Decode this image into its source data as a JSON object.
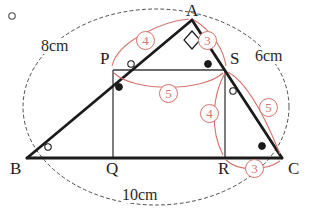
{
  "figure": {
    "vertices": [
      {
        "name": "A",
        "label": "A",
        "x": 192,
        "y": 20,
        "label_x": 186,
        "label_y": 2
      },
      {
        "name": "B",
        "label": "B",
        "x": 27,
        "y": 158,
        "label_x": 10,
        "label_y": 160
      },
      {
        "name": "C",
        "label": "C",
        "x": 282,
        "y": 158,
        "label_x": 288,
        "label_y": 160
      },
      {
        "name": "P",
        "label": "P",
        "x": 113,
        "y": 70,
        "label_x": 100,
        "label_y": 50
      },
      {
        "name": "S",
        "label": "S",
        "x": 225,
        "y": 70,
        "label_x": 230,
        "label_y": 50
      },
      {
        "name": "Q",
        "label": "Q",
        "x": 113,
        "y": 158,
        "label_x": 106,
        "label_y": 160
      },
      {
        "name": "R",
        "label": "R",
        "x": 225,
        "y": 158,
        "label_x": 218,
        "label_y": 160
      }
    ],
    "dimensions": [
      {
        "name": "side-ab-length",
        "text": "8cm",
        "x": 40,
        "y": 38
      },
      {
        "name": "side-ac-length",
        "text": "6cm",
        "x": 254,
        "y": 48
      },
      {
        "name": "side-bc-length",
        "text": "10cm",
        "x": 121,
        "y": 187
      }
    ],
    "segment_values": [
      {
        "name": "segment-ap-value",
        "value": "4",
        "x": 136,
        "y": 31
      },
      {
        "name": "segment-as-value",
        "value": "3",
        "x": 198,
        "y": 31
      },
      {
        "name": "segment-ps-value",
        "value": "5",
        "x": 159,
        "y": 84
      },
      {
        "name": "segment-sr-value",
        "value": "4",
        "x": 200,
        "y": 104
      },
      {
        "name": "segment-sc-value",
        "value": "5",
        "x": 259,
        "y": 98
      },
      {
        "name": "segment-rc-value",
        "value": "3",
        "x": 245,
        "y": 159
      }
    ],
    "angle_marks": [
      {
        "name": "angle-mark-b",
        "style": "hollow",
        "x": 48,
        "y": 147
      },
      {
        "name": "angle-mark-c",
        "style": "filled",
        "x": 262,
        "y": 146
      },
      {
        "name": "angle-mark-p-hollow",
        "style": "hollow",
        "x": 131,
        "y": 64
      },
      {
        "name": "angle-mark-p-filled",
        "style": "filled",
        "x": 119,
        "y": 87
      },
      {
        "name": "angle-mark-s-filled",
        "style": "filled",
        "x": 208,
        "y": 64
      },
      {
        "name": "angle-mark-s-hollow",
        "style": "hollow",
        "x": 233,
        "y": 91
      },
      {
        "name": "stray-circle-mark",
        "style": "hollow",
        "x": 12,
        "y": 16
      }
    ],
    "right_angle": {
      "name": "right-angle-mark-a",
      "at": "A",
      "x": 192,
      "y": 20
    },
    "colors": {
      "stroke": "#1b1b1b",
      "thin_stroke": "#3a3a3a",
      "annotation": "#d4736b",
      "dashed": "#4a4a4a",
      "background": "#ffffff"
    }
  }
}
